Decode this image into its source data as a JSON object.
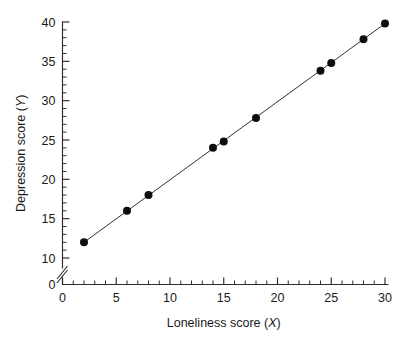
{
  "chart_data": {
    "type": "scatter",
    "title": "",
    "subtitle": "",
    "xlabel": "Loneliness score (X)",
    "xlabel_text": "Loneliness score (",
    "xlabel_var": "X",
    "xlabel_close": ")",
    "ylabel": "Depression score (Y)",
    "ylabel_text": "Depression score (",
    "ylabel_var": "Y",
    "ylabel_close": ")",
    "x": [
      2,
      6,
      8,
      14,
      15,
      18,
      24,
      25,
      28,
      30
    ],
    "y": [
      12,
      16,
      18,
      24,
      24.8,
      27.8,
      33.8,
      34.8,
      37.8,
      39.8
    ],
    "points": [
      {
        "x": 2,
        "y": 12
      },
      {
        "x": 6,
        "y": 16
      },
      {
        "x": 8,
        "y": 18
      },
      {
        "x": 14,
        "y": 24
      },
      {
        "x": 15,
        "y": 24.8
      },
      {
        "x": 18,
        "y": 27.8
      },
      {
        "x": 24,
        "y": 33.8
      },
      {
        "x": 25,
        "y": 34.8
      },
      {
        "x": 28,
        "y": 37.8
      },
      {
        "x": 30,
        "y": 39.8
      }
    ],
    "trend_line": {
      "visible": true,
      "x_start": 2,
      "y_start": 12,
      "x_end": 30,
      "y_end": 39.8
    },
    "xlim": [
      0,
      30
    ],
    "ylim": [
      10,
      40
    ],
    "y_axis_break": true,
    "y_axis_break_label": "0",
    "xticks": [
      0,
      5,
      10,
      15,
      20,
      25,
      30
    ],
    "xtick_labels": [
      "0",
      "5",
      "10",
      "15",
      "20",
      "25",
      "30"
    ],
    "x_minor_tick_step": 1,
    "yticks": [
      10,
      15,
      20,
      25,
      30,
      35,
      40
    ],
    "ytick_labels": [
      "10",
      "15",
      "20",
      "25",
      "30",
      "35",
      "40"
    ],
    "y_minor_tick_step": 1,
    "grid": false,
    "legend": null,
    "legend_position": "none",
    "marker": "filled-circle",
    "marker_color": "#0d0d0d",
    "line_color": "#33322f",
    "axis_color": "#2b2b2b",
    "background_color": "#ffffff"
  }
}
